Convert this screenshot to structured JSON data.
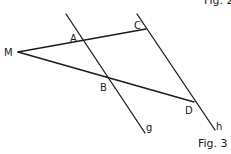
{
  "figure": {
    "caption_top_partial": "Fig. 2",
    "caption": "Fig. 3",
    "points": {
      "M": "M",
      "A": "A",
      "B": "B",
      "C": "C",
      "D": "D"
    },
    "lines": {
      "g": "g",
      "h": "h"
    },
    "colors": {
      "stroke": "#1a1a1a",
      "background": "#ffffff"
    }
  }
}
